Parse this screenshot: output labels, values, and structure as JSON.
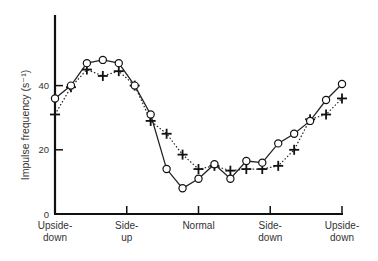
{
  "chart_data": {
    "type": "line",
    "title": "",
    "xlabel": "",
    "ylabel": "Impulse frequency (s⁻¹)",
    "ylim": [
      0,
      60
    ],
    "yticks": [
      0,
      20,
      40
    ],
    "grid": false,
    "legend": null,
    "x_tick_labels": [
      {
        "line1": "Upside-",
        "line2": "down"
      },
      {
        "line1": "Side-",
        "line2": "up"
      },
      {
        "line1": "Normal",
        "line2": ""
      },
      {
        "line1": "Side-",
        "line2": "down"
      },
      {
        "line1": "Upside-",
        "line2": "down"
      }
    ],
    "x": [
      0,
      1,
      2,
      3,
      4,
      5,
      6,
      7,
      8,
      9,
      10,
      11,
      12,
      13,
      14,
      15,
      16,
      17,
      18
    ],
    "series": [
      {
        "name": "circles (solid line)",
        "marker": "circle",
        "line": "solid",
        "values": [
          36,
          40,
          47,
          48,
          47,
          40,
          31,
          14,
          8,
          11,
          15.5,
          11,
          16.5,
          16,
          22,
          25,
          29,
          35.5,
          40.5
        ]
      },
      {
        "name": "crosses (dotted line)",
        "marker": "cross",
        "line": "dotted",
        "values": [
          31,
          39.5,
          45,
          43,
          44.5,
          40,
          29,
          25,
          18.5,
          14,
          15,
          13.5,
          14,
          14,
          15,
          20,
          29.5,
          31,
          36
        ]
      }
    ]
  }
}
